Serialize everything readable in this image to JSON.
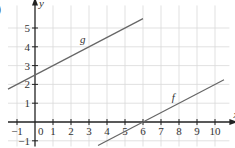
{
  "corner_label": ")",
  "chart_data": {
    "type": "line",
    "title": "",
    "xlabel": "x",
    "ylabel": "y",
    "xlim": [
      -1.5,
      10.8
    ],
    "ylim": [
      -1.3,
      6.2
    ],
    "grid": true,
    "x_ticks": [
      -1,
      0,
      1,
      2,
      3,
      4,
      5,
      6,
      7,
      8,
      9,
      10
    ],
    "y_ticks": [
      -1,
      1,
      2,
      3,
      4,
      5
    ],
    "series": [
      {
        "name": "g",
        "x": [
          -1.5,
          6
        ],
        "y": [
          1.75,
          5.5
        ],
        "slope": 0.5,
        "intercept": 2.5
      },
      {
        "name": "f",
        "x": [
          3.5,
          10.5
        ],
        "y": [
          -1.25,
          2.25
        ],
        "slope": 0.5,
        "intercept": -3
      }
    ],
    "annotations": [
      {
        "text": "g",
        "x": 2.5,
        "y": 4.2
      },
      {
        "text": "f",
        "x": 7.6,
        "y": 1.1
      }
    ]
  }
}
